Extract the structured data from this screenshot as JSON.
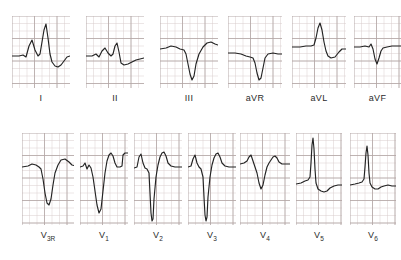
{
  "figure": {
    "background_color": "#ffffff",
    "trace_color": "#232323",
    "grid_minor_color": "#d9cdcc",
    "grid_major_color": "#b3a6a5",
    "rows": 2,
    "total_panels": 13
  },
  "rows": [
    {
      "name": "limb-leads-row",
      "panels": [
        {
          "label": "I",
          "label_main": "I",
          "label_sub": "",
          "x": 12,
          "y": 16,
          "w": 58,
          "h": 72,
          "grid_minor_px": 7.5,
          "grid_major_px": 22.5,
          "baseline_frac": 0.56,
          "trace": "M0,40 L7,40 L11,39 L14,41 L17,30 L20,24 L23,34 L26,40 L28,38 L30,26 L32,14 L34,8 L36,22 L38,38 L40,46 L43,50 L46,51 L49,49 L52,45 L55,41 L58,40 L62,40"
        },
        {
          "label": "II",
          "label_main": "II",
          "label_sub": "",
          "x": 86,
          "y": 16,
          "w": 58,
          "h": 72,
          "grid_minor_px": 7.5,
          "grid_major_px": 22.5,
          "baseline_frac": 0.56,
          "trace": "M0,40 L6,40 L10,38 L13,41 L16,35 L19,32 L22,37 L25,40 L27,38 L29,30 L31,27 L33,36 L35,47 L38,49 L42,48 L46,46 L50,44 L54,43 L58,42 L62,42"
        },
        {
          "label": "III",
          "label_main": "III",
          "label_sub": "",
          "x": 160,
          "y": 16,
          "w": 58,
          "h": 72,
          "grid_minor_px": 7.5,
          "grid_major_px": 22.5,
          "baseline_frac": 0.45,
          "trace": "M0,33 L6,32 L11,30 L16,31 L20,33 L24,34 L26,38 L28,48 L30,58 L32,64 L34,60 L36,48 L39,38 L43,31 L47,27 L51,26 L55,28 L58,29 L62,29"
        }
      ]
    },
    {
      "name": "augmented-leads-row",
      "panels": [
        {
          "label": "aVR",
          "label_main": "aVR",
          "label_sub": "",
          "x": 228,
          "y": 16,
          "w": 54,
          "h": 72,
          "grid_minor_px": 7.5,
          "grid_major_px": 22.5,
          "baseline_frac": 0.52,
          "trace": "M0,37 L7,37 L13,38 L18,40 L22,41 L25,42 L27,47 L29,57 L31,64 L33,62 L35,52 L37,42 L40,38 L45,37 L50,38 L54,38 L58,38"
        },
        {
          "label": "aVL",
          "label_main": "aVL",
          "label_sub": "",
          "x": 292,
          "y": 16,
          "w": 54,
          "h": 72,
          "grid_minor_px": 7.5,
          "grid_major_px": 22.5,
          "baseline_frac": 0.44,
          "trace": "M0,31 L8,31 L14,30 L19,30 L22,29 L24,22 L26,12 L28,7 L30,14 L32,26 L34,35 L36,40 L39,42 L43,41 L47,36 L50,33 L54,33 L58,33"
        },
        {
          "label": "aVF",
          "label_main": "aVF",
          "label_sub": "",
          "x": 354,
          "y": 16,
          "w": 47,
          "h": 72,
          "grid_minor_px": 7.5,
          "grid_major_px": 22.5,
          "baseline_frac": 0.44,
          "trace": "M0,31 L6,31 L11,30 L15,31 L17,28 L19,33 L21,43 L23,48 L25,42 L27,35 L29,32 L33,31 L38,30 L43,30 L47,30"
        }
      ]
    },
    {
      "name": "precordial-leads-row",
      "panels": [
        {
          "label": "V3R",
          "label_main": "V",
          "label_sub": "3R",
          "x": 22,
          "y": 133,
          "w": 52,
          "h": 92,
          "grid_minor_px": 7.5,
          "grid_major_px": 22.5,
          "baseline_frac": 0.37,
          "trace": "M0,34 L6,33 L10,31 L14,32 L17,34 L19,36 L21,46 L23,60 L25,70 L27,72 L29,66 L31,52 L33,40 L36,32 L39,27 L43,26 L47,29 L50,32 L54,33"
        },
        {
          "label": "V1",
          "label_main": "V",
          "label_sub": "1",
          "x": 80,
          "y": 133,
          "w": 48,
          "h": 92,
          "grid_minor_px": 7.5,
          "grid_major_px": 22.5,
          "baseline_frac": 0.37,
          "trace": "M0,34 L3,33 L5,30 L7,36 L9,32 L11,35 L13,44 L15,58 L17,72 L19,80 L21,76 L23,58 L25,40 L27,28 L29,22 L31,20 L33,23 L35,30 L37,34 L40,34 L42,33 L43,22 L45,20 L49,20 L51,21 L52,31 L55,33 L58,33"
        },
        {
          "label": "V2",
          "label_main": "V",
          "label_sub": "2",
          "x": 134,
          "y": 133,
          "w": 48,
          "h": 92,
          "grid_minor_px": 7.5,
          "grid_major_px": 22.5,
          "baseline_frac": 0.37,
          "trace": "M0,35 L3,34 L5,24 L7,21 L9,30 L11,35 L13,36 L15,40 L16,60 L17,80 L18,88 L19,86 L20,66 L22,44 L24,32 L26,24 L28,20 L30,19 L32,23 L34,30 L37,33 L41,34 L45,34 L48,34"
        },
        {
          "label": "V3",
          "label_main": "V",
          "label_sub": "3",
          "x": 188,
          "y": 133,
          "w": 48,
          "h": 92,
          "grid_minor_px": 7.5,
          "grid_major_px": 22.5,
          "baseline_frac": 0.37,
          "trace": "M0,34 L3,33 L5,26 L7,22 L9,30 L11,34 L13,36 L15,44 L16,64 L17,82 L18,88 L19,84 L20,64 L22,44 L24,32 L26,25 L28,21 L30,20 L32,24 L34,30 L37,33 L41,34 L45,34 L48,34"
        },
        {
          "label": "V4",
          "label_main": "V",
          "label_sub": "4",
          "x": 240,
          "y": 133,
          "w": 50,
          "h": 92,
          "grid_minor_px": 7.5,
          "grid_major_px": 22.5,
          "baseline_frac": 0.33,
          "trace": "M0,31 L4,30 L7,28 L9,24 L11,22 L13,28 L15,34 L17,40 L19,50 L21,56 L23,52 L25,42 L27,34 L29,30 L31,27 L33,24 L35,23 L37,25 L39,29 L42,31 L46,31 L50,31"
        },
        {
          "label": "V5",
          "label_main": "V",
          "label_sub": "5",
          "x": 296,
          "y": 133,
          "w": 46,
          "h": 92,
          "grid_minor_px": 7.5,
          "grid_major_px": 22.5,
          "baseline_frac": 0.55,
          "trace": "M0,51 L5,50 L9,48 L12,47 L14,44 L15,30 L16,12 L17,5 L18,16 L19,36 L20,50 L22,56 L25,58 L28,59 L31,58 L34,55 L38,53 L42,52 L46,52"
        },
        {
          "label": "V6",
          "label_main": "V",
          "label_sub": "6",
          "x": 350,
          "y": 133,
          "w": 46,
          "h": 92,
          "grid_minor_px": 7.5,
          "grid_major_px": 22.5,
          "baseline_frac": 0.55,
          "trace": "M0,52 L5,51 L9,50 L12,49 L14,46 L15,34 L16,20 L17,13 L18,22 L19,40 L20,50 L22,54 L25,56 L28,56 L31,54 L34,53 L38,52 L42,53 L46,53"
        }
      ]
    }
  ]
}
